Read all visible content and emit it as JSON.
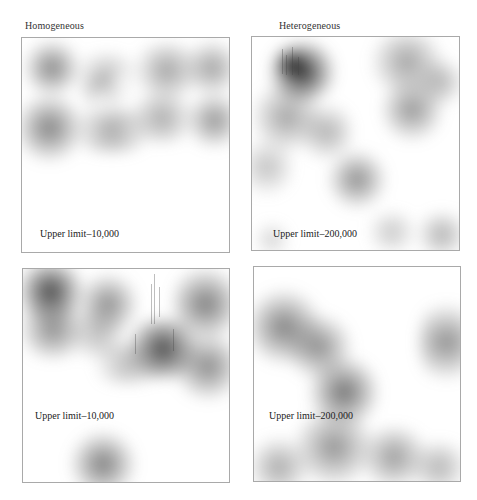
{
  "columns": {
    "left": "Homogeneous",
    "right": "Heterogeneous"
  },
  "panels": [
    {
      "id": "top-left",
      "column": "Homogeneous",
      "row": 1,
      "label": "Upper limit–10,000"
    },
    {
      "id": "top-right",
      "column": "Heterogeneous",
      "row": 1,
      "label": "Upper limit–200,000"
    },
    {
      "id": "bottom-left",
      "column": "Homogeneous",
      "row": 2,
      "label": "Upper limit–10,000"
    },
    {
      "id": "bottom-right",
      "column": "Heterogeneous",
      "row": 2,
      "label": "Upper limit–200,000"
    }
  ],
  "colors": {
    "density": "#505050",
    "border": "#a9a9a9",
    "background": "#ffffff"
  }
}
